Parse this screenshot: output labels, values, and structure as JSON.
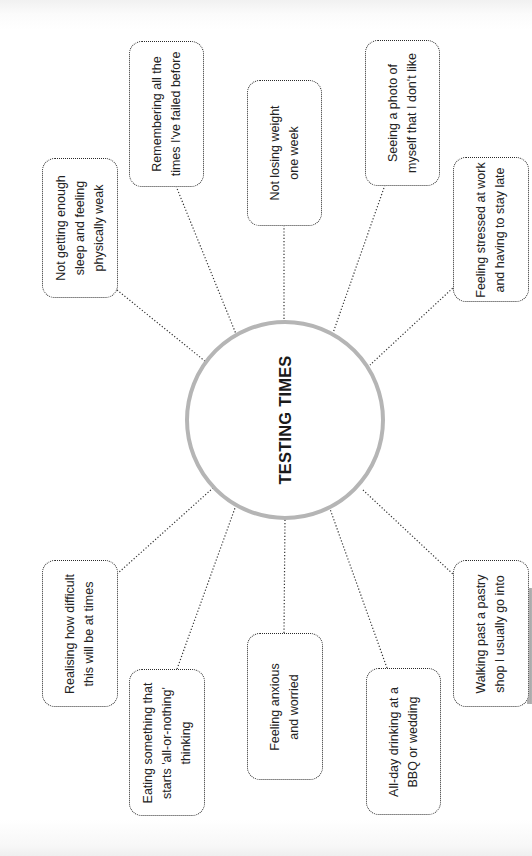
{
  "diagram": {
    "type": "mind-map",
    "orientation": "rotated-90-ccw",
    "center": {
      "title": "TESTING TIMES",
      "ring_color": "#b5b5b5"
    },
    "colors": {
      "border": "#2a2a2a",
      "text": "#222222",
      "connector": "#333333"
    },
    "nodes": [
      {
        "id": "n1",
        "lines": [
          "Not getting enough",
          "sleep and feeling",
          "physically weak"
        ]
      },
      {
        "id": "n2",
        "lines": [
          "Remembering all the",
          "times I've failed before"
        ]
      },
      {
        "id": "n3",
        "lines": [
          "Not losing weight",
          "one week"
        ]
      },
      {
        "id": "n4",
        "lines": [
          "Seeing a photo of",
          "myself that I don't like"
        ]
      },
      {
        "id": "n5",
        "lines": [
          "Feeling stressed at work",
          "and having to stay late"
        ]
      },
      {
        "id": "n6",
        "lines": [
          "Realising how difficult",
          "this will be at times"
        ]
      },
      {
        "id": "n7",
        "lines": [
          "Eating something that",
          "starts 'all-or-nothing'",
          "thinking"
        ]
      },
      {
        "id": "n8",
        "lines": [
          "Feeling anxious",
          "and worried"
        ]
      },
      {
        "id": "n9",
        "lines": [
          "All-day drinking at a",
          "BBQ or wedding"
        ]
      },
      {
        "id": "n10",
        "lines": [
          "Walking past a pastry",
          "shop I usually go into"
        ]
      }
    ]
  }
}
